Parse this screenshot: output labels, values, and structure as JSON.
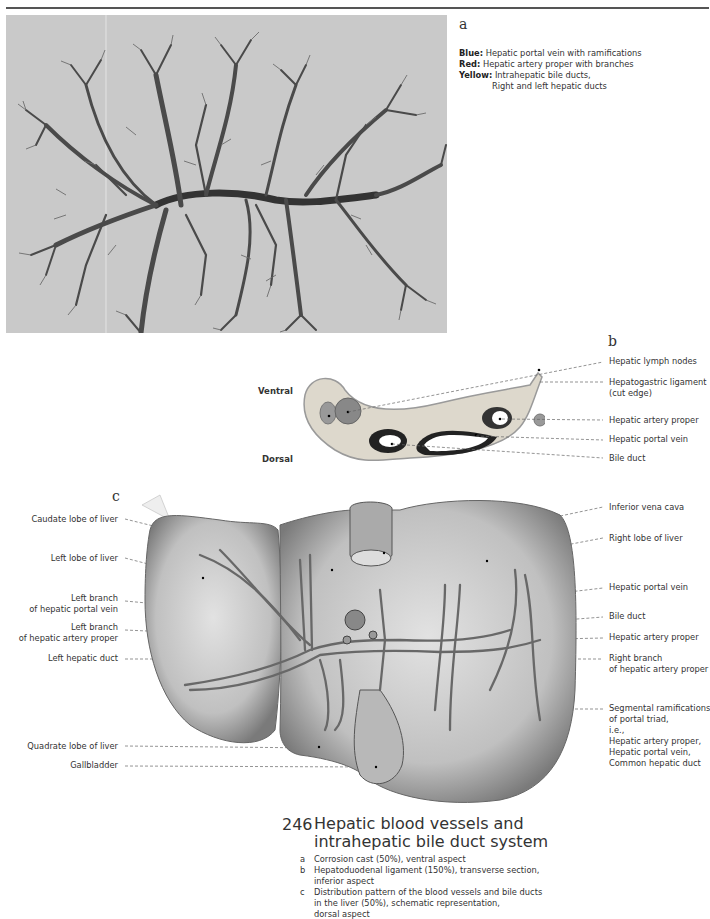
{
  "figure": {
    "number": "246",
    "title_line1": "Hepatic blood vessels and",
    "title_line2": "intrahepatic bile duct system",
    "captions": [
      {
        "letter": "a",
        "lines": [
          "Corrosion cast (50%), ventral aspect"
        ]
      },
      {
        "letter": "b",
        "lines": [
          "Hepatoduodenal ligament (150%), transverse section,",
          "inferior aspect"
        ]
      },
      {
        "letter": "c",
        "lines": [
          "Distribution pattern of the blood vessels and bile ducts",
          "in the liver (50%), schematic representation,",
          "dorsal aspect"
        ]
      }
    ]
  },
  "panel_a": {
    "letter": "a",
    "legend": [
      {
        "key": "Blue:",
        "text": "Hepatic portal vein with ramifications"
      },
      {
        "key": "Red:",
        "text": "Hepatic artery proper with branches"
      },
      {
        "key": "Yellow:",
        "text": "Intrahepatic bile ducts,"
      },
      {
        "key": "",
        "text": "Right and left hepatic ducts"
      }
    ]
  },
  "panel_b": {
    "letter": "b",
    "orientation": {
      "top": "Ventral",
      "bottom": "Dorsal"
    },
    "labels": [
      "Hepatic lymph nodes",
      "Hepatogastric ligament",
      "(cut edge)",
      "Hepatic artery proper",
      "Hepatic portal vein",
      "Bile duct"
    ]
  },
  "panel_c": {
    "letter": "c",
    "left_labels": [
      {
        "lines": [
          "Caudate lobe of liver"
        ]
      },
      {
        "lines": [
          "Left lobe of liver"
        ]
      },
      {
        "lines": [
          "Left branch",
          "of hepatic portal vein"
        ]
      },
      {
        "lines": [
          "Left branch",
          "of hepatic artery proper"
        ]
      },
      {
        "lines": [
          "Left hepatic duct"
        ]
      },
      {
        "lines": [
          "Quadrate lobe of liver"
        ]
      },
      {
        "lines": [
          "Gallbladder"
        ]
      }
    ],
    "right_labels": [
      {
        "lines": [
          "Inferior vena cava"
        ]
      },
      {
        "lines": [
          "Right lobe of liver"
        ]
      },
      {
        "lines": [
          "Hepatic portal vein"
        ]
      },
      {
        "lines": [
          "Bile duct"
        ]
      },
      {
        "lines": [
          "Hepatic artery proper"
        ]
      },
      {
        "lines": [
          "Right branch",
          "of hepatic artery proper"
        ]
      },
      {
        "lines": [
          "Segmental ramifications",
          "of portal triad,",
          "i.e.,",
          "Hepatic artery proper,",
          "Hepatic portal vein,",
          "Common hepatic duct"
        ]
      }
    ]
  },
  "colors": {
    "photo_bg": "#c9c9c9",
    "cast": "#5a5a5a",
    "liver_fill": "#c4c4c4",
    "vessel": "#6a6a6a",
    "text": "#333333"
  }
}
